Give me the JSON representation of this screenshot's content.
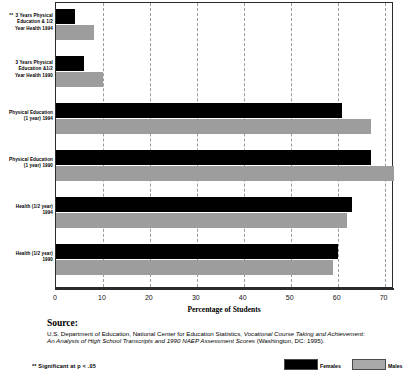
{
  "chart_data": {
    "type": "bar",
    "orientation": "horizontal",
    "title": "",
    "xlabel": "Percentage of Students",
    "ylabel": "",
    "xlim": [
      0,
      70
    ],
    "xticks": [
      0,
      10,
      20,
      30,
      40,
      50,
      60,
      70
    ],
    "grid": "vertical dashed gridlines at each 10-unit tick",
    "legend_position": "bottom-right",
    "categories": [
      "** 3 Years Physical Education & 1/2 Year Health 1994",
      "3 Years Physical Education &1/2 Year Health 1990",
      "Physical Education (1 year) 1994",
      "Physical Education (1 year) 1990",
      "Health (1/2 year) 1994",
      "Health (1/2 year) 1990"
    ],
    "series": [
      {
        "name": "Females",
        "color": "#000000",
        "values": [
          4,
          6,
          61,
          67,
          63,
          60
        ]
      },
      {
        "name": "Males",
        "color": "#9d9d9d",
        "values": [
          8,
          10,
          67,
          72,
          62,
          59
        ]
      }
    ]
  },
  "categories_display": [
    {
      "marker": "**",
      "lines": [
        "3 Years Physical",
        "Education & 1/2",
        "Year Health 1994"
      ]
    },
    {
      "marker": "",
      "lines": [
        "3 Years Physical",
        "Education &1/2",
        "Year Health 1990"
      ]
    },
    {
      "marker": "",
      "lines": [
        "Physical Education",
        "(1 year) 1994"
      ]
    },
    {
      "marker": "",
      "lines": [
        "Physical Education",
        "(1 year) 1990"
      ]
    },
    {
      "marker": "",
      "lines": [
        "Health (1/2 year)",
        "1994"
      ]
    },
    {
      "marker": "",
      "lines": [
        "Health (1/2 year)",
        "1990"
      ]
    }
  ],
  "axis": {
    "x_title": "Percentage of Students",
    "x_tick_labels": [
      "0",
      "10",
      "20",
      "30",
      "40",
      "50",
      "60",
      "70"
    ]
  },
  "legend": {
    "items": [
      {
        "label": "Females",
        "color": "#000000"
      },
      {
        "label": "Males",
        "color": "#a9a9a9"
      }
    ]
  },
  "source": {
    "heading": "Source:",
    "line1_plain_a": "U.S. Department of Education, National Center for Education Statistics, ",
    "line1_italic": "Vocational Course Taking and Achievement:",
    "line2_italic": "An Analysis of High School Transcripts and 1990 NAEP Assessment Scores ",
    "line2_plain": "(Washington, DC: 1995)."
  },
  "footnote": {
    "text": "**  Significant at p < .05"
  },
  "colors": {
    "female_bar": "#000000",
    "male_bar": "#9d9d9d",
    "gridline": "#9a9a9a",
    "axis": "#2b2b2b"
  }
}
